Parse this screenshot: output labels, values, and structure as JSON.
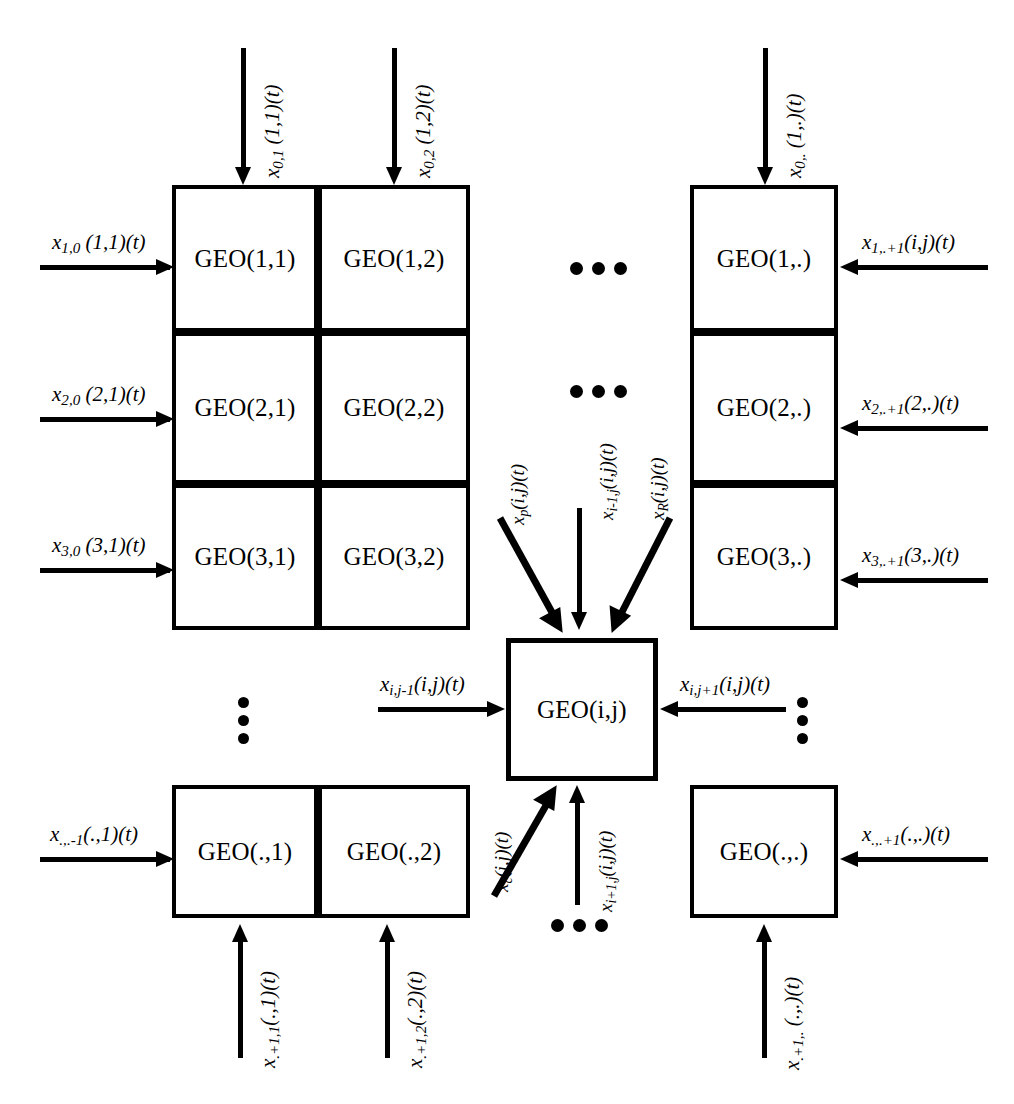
{
  "diagram": {
    "node_prefix": "GEO",
    "ink_color": "#000000",
    "background_color": "#ffffff"
  },
  "grid": {
    "top_left_block": [
      {
        "id": "geo-1-1",
        "label": "GEO(1,1)"
      },
      {
        "id": "geo-1-2",
        "label": "GEO(1,2)"
      },
      {
        "id": "geo-2-1",
        "label": "GEO(2,1)"
      },
      {
        "id": "geo-2-2",
        "label": "GEO(2,2)"
      },
      {
        "id": "geo-3-1",
        "label": "GEO(3,1)"
      },
      {
        "id": "geo-3-2",
        "label": "GEO(3,2)"
      }
    ],
    "top_right_block": [
      {
        "id": "geo-1-dot",
        "label": "GEO(1,.)"
      },
      {
        "id": "geo-2-dot",
        "label": "GEO(2,.)"
      },
      {
        "id": "geo-3-dot",
        "label": "GEO(3,.)"
      }
    ],
    "bottom_left_block": [
      {
        "id": "geo-dot-1",
        "label": "GEO(.,1)"
      },
      {
        "id": "geo-dot-2",
        "label": "GEO(.,2)"
      }
    ],
    "bottom_right_block": [
      {
        "id": "geo-dot-dot",
        "label": "GEO(.,.)"
      }
    ],
    "center": {
      "id": "geo-i-j",
      "label": "GEO(i,j)"
    }
  },
  "labels": {
    "top_in_1_1": {
      "base": "x",
      "sub": "0,1",
      "rest": " (1,1)(t)"
    },
    "top_in_1_2": {
      "base": "x",
      "sub": "0,2",
      "rest": " (1,2)(t)"
    },
    "top_in_1_dot": {
      "base": "x",
      "sub": "0,.",
      "rest": " (1,.)(t)"
    },
    "left_in_1_1": {
      "base": "x",
      "sub": "1,0",
      "rest": " (1,1)(t)"
    },
    "left_in_2_1": {
      "base": "x",
      "sub": "2,0",
      "rest": " (2,1)(t)"
    },
    "left_in_3_1": {
      "base": "x",
      "sub": "3,0",
      "rest": " (3,1)(t)"
    },
    "right_in_1_dot": {
      "base": "x",
      "sub": "1,.+1",
      "rest": "(i,j)(t)"
    },
    "right_in_2_dot": {
      "base": "x",
      "sub": "2,.+1",
      "rest": "(2,.)(t)"
    },
    "right_in_3_dot": {
      "base": "x",
      "sub": "3,.+1",
      "rest": "(3,.)(t)"
    },
    "center_top_left_diag": {
      "base": "x",
      "sub": "p",
      "rest": "(i,j)(t)"
    },
    "center_top_vertical": {
      "base": "x",
      "sub": "i-1,j",
      "rest": "(i,j)(t)"
    },
    "center_top_right_diag": {
      "base": "x",
      "sub": "R",
      "rest": "(i,j)(t)"
    },
    "center_left_in": {
      "base": "x",
      "sub": "i,j-1",
      "rest": "(i,j)(t)"
    },
    "center_right_in": {
      "base": "x",
      "sub": "i,j+1",
      "rest": "(i,j)(t)"
    },
    "center_bottom_left_diag": {
      "base": "x",
      "sub": "c",
      "rest": "(i,j)(t)"
    },
    "center_bottom_vertical": {
      "base": "x",
      "sub": "i+1,j",
      "rest": "(i,j)(t)"
    },
    "left_in_dot_1": {
      "base": "x",
      "sub": ".,.-1",
      "rest": "(.,1)(t)"
    },
    "right_in_dot_dot": {
      "base": "x",
      "sub": ".,.+1",
      "rest": "(.,.)(t)"
    },
    "bottom_out_dot_1": {
      "base": "x",
      "sub": ".+1,1",
      "rest": "(.,1)(t)"
    },
    "bottom_out_dot_2": {
      "base": "x",
      "sub": ".+1,2",
      "rest": "(.,2)(t)"
    },
    "bottom_out_dot_dot": {
      "base": "x",
      "sub": ".+1,.",
      "rest": " (.,.)(t)"
    }
  },
  "ellipses": {
    "row1_horizontal": "•••",
    "row2_horizontal": "•••",
    "left_vertical": "•••",
    "right_vertical": "•••",
    "bottom_horizontal": "•••"
  }
}
